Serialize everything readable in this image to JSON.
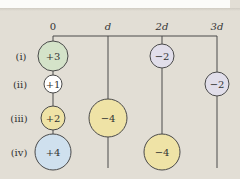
{
  "diagram": {
    "axis": {
      "ticks": [
        {
          "label": "0",
          "x": 53,
          "italic": false
        },
        {
          "label": "d",
          "x": 108,
          "italic": true
        },
        {
          "label": "2d",
          "x": 162,
          "italic": true
        },
        {
          "label": "3d",
          "x": 217,
          "italic": true
        }
      ]
    },
    "rows": [
      {
        "label": "(i)",
        "y": 56
      },
      {
        "label": "(ii)",
        "y": 84
      },
      {
        "label": "(iii)",
        "y": 118
      },
      {
        "label": "(iv)",
        "y": 152
      }
    ],
    "charges": [
      {
        "id": "i-0",
        "value": "+3",
        "x": 53,
        "y": 56,
        "r": 15,
        "fill": "#d4e3c9"
      },
      {
        "id": "i-2d",
        "value": "−2",
        "x": 162,
        "y": 56,
        "r": 12,
        "fill": "#e1deea"
      },
      {
        "id": "ii-0",
        "value": "+1",
        "x": 53,
        "y": 84,
        "r": 9,
        "fill": "#ffffff"
      },
      {
        "id": "ii-3d",
        "value": "−2",
        "x": 217,
        "y": 84,
        "r": 12,
        "fill": "#e1deea"
      },
      {
        "id": "iii-0",
        "value": "+2",
        "x": 53,
        "y": 118,
        "r": 12,
        "fill": "#efe3a6"
      },
      {
        "id": "iii-d",
        "value": "−4",
        "x": 108,
        "y": 118,
        "r": 19,
        "fill": "#efe3a6"
      },
      {
        "id": "iv-0",
        "value": "+4",
        "x": 53,
        "y": 152,
        "r": 18,
        "fill": "#cfe0ee"
      },
      {
        "id": "iv-2d",
        "value": "−4",
        "x": 162,
        "y": 152,
        "r": 18,
        "fill": "#efe3a6"
      }
    ],
    "colors": {
      "background": "#e2ded5",
      "line": "#4a4a4a",
      "text": "#333333"
    }
  }
}
